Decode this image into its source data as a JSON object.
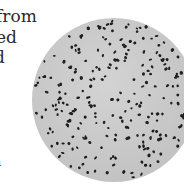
{
  "page_text": {
    "lines": [
      "from",
      "ed",
      "d",
      "a"
    ]
  },
  "figure": {
    "background_color": "#c9c9c9",
    "dot_color": "#1e1e1e"
  }
}
